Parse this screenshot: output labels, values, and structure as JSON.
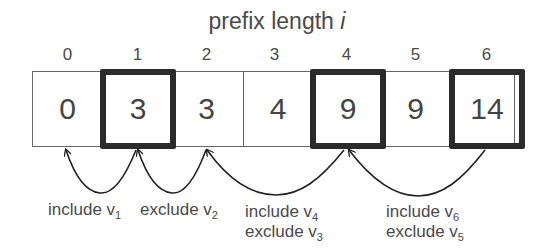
{
  "title": {
    "text": "prefix length ",
    "var": "i"
  },
  "indices": [
    "0",
    "1",
    "2",
    "3",
    "4",
    "5",
    "6"
  ],
  "cells": [
    {
      "index": 0,
      "value": "0",
      "highlighted": false
    },
    {
      "index": 1,
      "value": "3",
      "highlighted": true
    },
    {
      "index": 2,
      "value": "3",
      "highlighted": false
    },
    {
      "index": 3,
      "value": "4",
      "highlighted": false
    },
    {
      "index": 4,
      "value": "9",
      "highlighted": true
    },
    {
      "index": 5,
      "value": "9",
      "highlighted": false
    },
    {
      "index": 6,
      "value": "14",
      "highlighted": true
    }
  ],
  "arrows": [
    {
      "from": 1,
      "to": 0,
      "lines": [
        {
          "word": "include v",
          "sub": "1"
        }
      ]
    },
    {
      "from": 2,
      "to": 1,
      "lines": [
        {
          "word": "exclude v",
          "sub": "2"
        }
      ]
    },
    {
      "from": 4,
      "to": 2,
      "lines": [
        {
          "word": "include v",
          "sub": "4"
        },
        {
          "word": "exclude v",
          "sub": "3"
        }
      ]
    },
    {
      "from": 6,
      "to": 4,
      "lines": [
        {
          "word": "include v",
          "sub": "6"
        },
        {
          "word": "exclude v",
          "sub": "5"
        }
      ]
    }
  ],
  "colors": {
    "thick_border": "#2b2b2b",
    "thin_border": "#666666",
    "text": "#444444"
  }
}
